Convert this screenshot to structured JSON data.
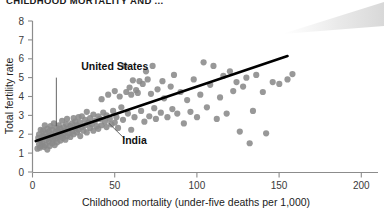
{
  "figure": {
    "title": "CHILDHOOD MORTALITY AND ...",
    "background_color": "#ffffff"
  },
  "chart_data": {
    "type": "scatter",
    "title": "CHILDHOOD MORTALITY AND ...",
    "xlabel": "Childhood mortality (under-five deaths per 1,000)",
    "ylabel": "Total fertility rate",
    "xlim": [
      0,
      210
    ],
    "ylim": [
      0,
      8.4
    ],
    "xticks": [
      0,
      50,
      100,
      150,
      200
    ],
    "xtick_labels": [
      "0",
      "50",
      "100",
      "150",
      "200"
    ],
    "yticks": [
      0,
      1,
      2,
      3,
      4,
      5,
      6,
      7,
      8
    ],
    "ytick_labels": [
      "0",
      "1",
      "2",
      "3",
      "4",
      "5",
      "6",
      "7",
      "8"
    ],
    "grid": false,
    "legend": false,
    "point_color": "#8a8a8a",
    "point_radius": 3.1,
    "point_opacity": 0.88,
    "series": [
      {
        "name": "Countries",
        "points": [
          [
            3,
            1.3
          ],
          [
            3.5,
            1.9
          ],
          [
            4,
            1.55
          ],
          [
            4,
            2.1
          ],
          [
            4.5,
            1.35
          ],
          [
            5,
            1.75
          ],
          [
            5,
            2.35
          ],
          [
            5.5,
            1.45
          ],
          [
            6,
            2.0
          ],
          [
            6,
            1.6
          ],
          [
            6.5,
            2.3
          ],
          [
            7,
            1.4
          ],
          [
            7,
            1.95
          ],
          [
            7.5,
            2.6
          ],
          [
            8,
            1.5
          ],
          [
            8,
            2.15
          ],
          [
            8.5,
            1.8
          ],
          [
            9,
            2.4
          ],
          [
            9,
            1.25
          ],
          [
            9.5,
            2.0
          ],
          [
            10,
            1.7
          ],
          [
            10,
            2.25
          ],
          [
            10.5,
            1.45
          ],
          [
            11,
            2.55
          ],
          [
            11,
            1.9
          ],
          [
            11.5,
            2.1
          ],
          [
            12,
            1.6
          ],
          [
            12,
            2.35
          ],
          [
            12.5,
            1.8
          ],
          [
            13,
            2.0
          ],
          [
            13,
            2.7
          ],
          [
            13.5,
            1.5
          ],
          [
            14,
            2.2
          ],
          [
            14,
            1.85
          ],
          [
            14.5,
            2.45
          ],
          [
            15,
            2.05
          ],
          [
            15,
            1.65
          ],
          [
            15.5,
            2.3
          ],
          [
            16,
            1.95
          ],
          [
            16,
            2.6
          ],
          [
            16.5,
            2.15
          ],
          [
            17,
            1.75
          ],
          [
            17,
            2.4
          ],
          [
            17.5,
            2.0
          ],
          [
            18,
            2.25
          ],
          [
            18,
            2.85
          ],
          [
            18.5,
            1.9
          ],
          [
            19,
            2.5
          ],
          [
            19,
            2.1
          ],
          [
            20,
            2.3
          ],
          [
            20,
            1.8
          ],
          [
            20.5,
            2.65
          ],
          [
            21,
            2.0
          ],
          [
            21,
            2.95
          ],
          [
            22,
            2.4
          ],
          [
            22,
            2.15
          ],
          [
            23,
            2.55
          ],
          [
            23,
            1.95
          ],
          [
            24,
            2.7
          ],
          [
            24,
            2.25
          ],
          [
            25,
            2.1
          ],
          [
            25,
            3.0
          ],
          [
            26,
            2.45
          ],
          [
            26,
            2.8
          ],
          [
            27,
            2.2
          ],
          [
            27,
            2.6
          ],
          [
            28,
            3.05
          ],
          [
            28,
            2.35
          ],
          [
            29,
            2.75
          ],
          [
            29,
            2.0
          ],
          [
            30,
            2.5
          ],
          [
            30,
            3.1
          ],
          [
            31,
            2.3
          ],
          [
            32,
            2.9
          ],
          [
            32,
            2.6
          ],
          [
            33,
            3.35
          ],
          [
            33,
            2.2
          ],
          [
            34,
            2.75
          ],
          [
            35,
            2.45
          ],
          [
            35,
            3.0
          ],
          [
            36,
            2.65
          ],
          [
            37,
            2.3
          ],
          [
            37,
            3.2
          ],
          [
            38,
            2.85
          ],
          [
            39,
            2.55
          ],
          [
            40,
            3.1
          ],
          [
            40,
            2.4
          ],
          [
            41,
            2.95
          ],
          [
            42,
            4.05
          ],
          [
            42,
            2.6
          ],
          [
            43,
            3.3
          ],
          [
            44,
            2.8
          ],
          [
            45,
            2.5
          ],
          [
            45,
            3.15
          ],
          [
            46,
            4.3
          ],
          [
            47,
            2.95
          ],
          [
            48,
            2.65
          ],
          [
            49,
            3.4
          ],
          [
            50,
            2.75
          ],
          [
            50,
            4.5
          ],
          [
            51,
            3.05
          ],
          [
            52,
            2.45
          ],
          [
            53,
            4.2
          ],
          [
            54,
            3.6
          ],
          [
            55,
            2.9
          ],
          [
            56,
            5.9
          ],
          [
            57,
            4.45
          ],
          [
            58,
            3.25
          ],
          [
            59,
            4.7
          ],
          [
            60,
            2.35
          ],
          [
            60,
            4.3
          ],
          [
            61,
            5.1
          ],
          [
            62,
            3.05
          ],
          [
            63,
            4.55
          ],
          [
            64,
            4.4
          ],
          [
            65,
            5.05
          ],
          [
            66,
            3.4
          ],
          [
            67,
            4.9
          ],
          [
            68,
            2.8
          ],
          [
            69,
            5.6
          ],
          [
            70,
            5.15
          ],
          [
            71,
            3.1
          ],
          [
            72,
            4.35
          ],
          [
            73,
            5.9
          ],
          [
            74,
            3.55
          ],
          [
            75,
            2.95
          ],
          [
            76,
            4.6
          ],
          [
            78,
            3.3
          ],
          [
            79,
            5.05
          ],
          [
            80,
            4.1
          ],
          [
            82,
            3.05
          ],
          [
            84,
            4.75
          ],
          [
            85,
            3.5
          ],
          [
            86,
            5.4
          ],
          [
            88,
            3.25
          ],
          [
            90,
            4.45
          ],
          [
            92,
            2.7
          ],
          [
            94,
            4.0
          ],
          [
            96,
            3.35
          ],
          [
            98,
            5.15
          ],
          [
            100,
            3.05
          ],
          [
            102,
            4.3
          ],
          [
            104,
            6.1
          ],
          [
            106,
            3.6
          ],
          [
            108,
            4.85
          ],
          [
            110,
            5.9
          ],
          [
            112,
            2.95
          ],
          [
            114,
            4.15
          ],
          [
            116,
            5.35
          ],
          [
            118,
            3.25
          ],
          [
            120,
            5.6
          ],
          [
            122,
            4.5
          ],
          [
            124,
            5.0
          ],
          [
            126,
            2.25
          ],
          [
            128,
            4.75
          ],
          [
            130,
            5.25
          ],
          [
            132,
            1.6
          ],
          [
            134,
            3.4
          ],
          [
            136,
            5.4
          ],
          [
            140,
            4.45
          ],
          [
            142,
            2.15
          ],
          [
            146,
            5.0
          ],
          [
            150,
            4.9
          ],
          [
            155,
            5.15
          ],
          [
            158,
            5.45
          ]
        ]
      }
    ],
    "trendline": {
      "name": "Linear fit",
      "color": "#000000",
      "width": 2.6,
      "x0": 2,
      "y0": 1.72,
      "x1": 155,
      "y1": 6.45
    },
    "annotations": [
      {
        "label": "United States",
        "text_x": 50,
        "text_y": 5.7,
        "leader": {
          "x0": 14.5,
          "y0": 5.25,
          "x1": 14.5,
          "y1": 2.55
        }
      },
      {
        "label": "India",
        "text_x": 62,
        "text_y": 1.55,
        "leader": {
          "x0": 56,
          "y0": 1.85,
          "x1": 46,
          "y1": 2.75
        }
      }
    ]
  },
  "axes": {
    "axis_color": "#8c8c8c",
    "tick_color": "#8c8c8c",
    "label_color": "#2d2d2d"
  }
}
